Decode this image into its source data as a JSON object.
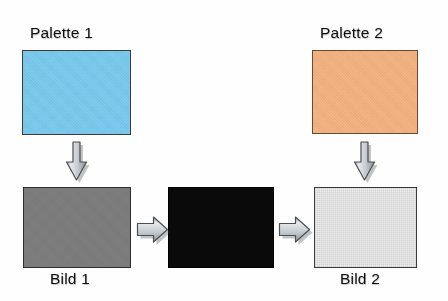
{
  "diagram": {
    "title_text": "",
    "background_color": "#fefefe",
    "nodes": [
      {
        "id": "palette-1",
        "label": "Palette 1",
        "label_position": "top",
        "fill_color": "#7CCBEE",
        "border_color": "#3b3b3b",
        "x": 22,
        "y": 50,
        "width": 109,
        "height": 85
      },
      {
        "id": "palette-2",
        "label": "Palette 2",
        "label_position": "top",
        "fill_color": "#F5B482",
        "border_color": "#6b4a30",
        "x": 312,
        "y": 50,
        "width": 106,
        "height": 84
      },
      {
        "id": "bild-1",
        "label": "Bild 1",
        "label_position": "bottom",
        "fill_color": "#7E7E7E",
        "border_color": "#2e2e2e",
        "x": 23,
        "y": 187,
        "width": 108,
        "height": 81
      },
      {
        "id": "result-black",
        "label": "",
        "label_position": "none",
        "fill_color": "#0A0A0A",
        "border_color": "#000000",
        "x": 168,
        "y": 187,
        "width": 106,
        "height": 81
      },
      {
        "id": "bild-2",
        "label": "Bild 2",
        "label_position": "bottom",
        "fill_color": "#EDEDEF",
        "border_color": "#3b3b3b",
        "x": 314,
        "y": 187,
        "width": 103,
        "height": 81
      }
    ],
    "arrows": [
      {
        "id": "arrow-palette1-to-bild1",
        "direction": "down",
        "from": "palette-1",
        "to": "bild-1",
        "x": 64,
        "y": 137,
        "width": 26,
        "height": 48
      },
      {
        "id": "arrow-bild1-to-black",
        "direction": "right",
        "from": "bild-1",
        "to": "result-black",
        "x": 135,
        "y": 213,
        "width": 32,
        "height": 30
      },
      {
        "id": "arrow-black-to-bild2",
        "direction": "right",
        "from": "result-black",
        "to": "bild-2",
        "x": 277,
        "y": 213,
        "width": 34,
        "height": 30
      },
      {
        "id": "arrow-palette2-to-bild2",
        "direction": "down",
        "from": "palette-2",
        "to": "bild-2",
        "x": 352,
        "y": 137,
        "width": 26,
        "height": 48
      }
    ],
    "arrow_style": {
      "fill_color": "#BFC5CB",
      "highlight_color": "#E4E8EB",
      "shade_color": "#8E959B",
      "outline_color": "#4A4F54"
    },
    "labels": [
      {
        "id": "label-palette-1",
        "text": "Palette 1",
        "x": 30,
        "y": 24
      },
      {
        "id": "label-palette-2",
        "text": "Palette 2",
        "x": 320,
        "y": 24
      },
      {
        "id": "label-bild-1",
        "text": "Bild 1",
        "x": 50,
        "y": 270
      },
      {
        "id": "label-bild-2",
        "text": "Bild 2",
        "x": 340,
        "y": 270
      }
    ]
  }
}
